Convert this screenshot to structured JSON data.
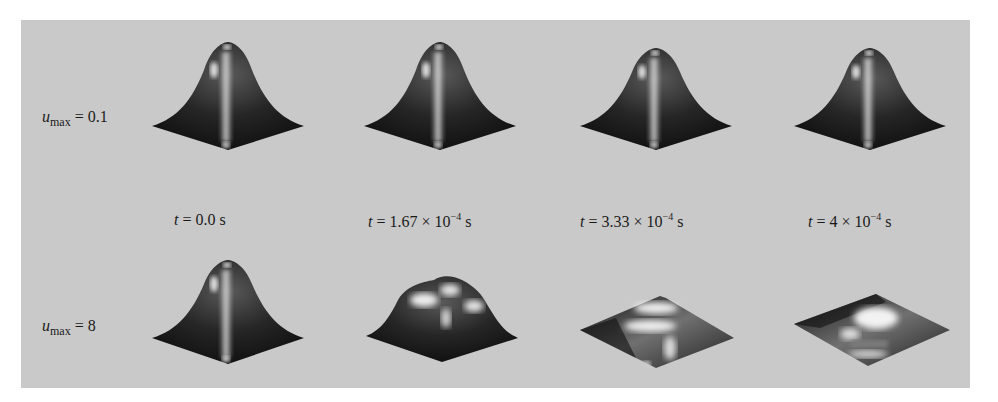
{
  "figure": {
    "background_color": "#c9c9c9",
    "surface_color": "#1e1e1e",
    "highlight_color": "#f2f2f2",
    "rows": [
      {
        "label_symbol": "u",
        "label_subscript": "max",
        "label_value": "= 0.1",
        "frames": [
          {
            "shape": "gaussian-bump"
          },
          {
            "shape": "gaussian-bump"
          },
          {
            "shape": "gaussian-bump"
          },
          {
            "shape": "gaussian-bump"
          }
        ]
      },
      {
        "label_symbol": "u",
        "label_subscript": "max",
        "label_value": "= 8",
        "frames": [
          {
            "shape": "gaussian-bump"
          },
          {
            "shape": "flattened-plateau"
          },
          {
            "shape": "flat-sheet"
          },
          {
            "shape": "flat-sheet-inverted"
          }
        ]
      }
    ],
    "time_labels": [
      {
        "var": "t",
        "eq": " = 0.0 s",
        "mantissa": "",
        "exp": "",
        "unit": ""
      },
      {
        "var": "t",
        "eq": " = 1.67 × 10",
        "exp": "−4",
        "unit": " s"
      },
      {
        "var": "t",
        "eq": " = 3.33 × 10",
        "exp": "−4",
        "unit": " s"
      },
      {
        "var": "t",
        "eq": " = 4 × 10",
        "exp": "−4",
        "unit": " s"
      }
    ]
  }
}
